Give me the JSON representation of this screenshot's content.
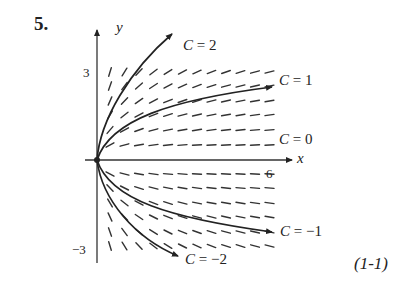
{
  "problem": {
    "number": "5."
  },
  "axes": {
    "x_label": "x",
    "y_label": "y",
    "x_tick": "6",
    "y_tick_top": "3",
    "y_tick_bottom": "−3"
  },
  "curves": [
    {
      "c_symbol": "C",
      "eq": " = 2"
    },
    {
      "c_symbol": "C",
      "eq": " = 1"
    },
    {
      "c_symbol": "C",
      "eq": " = 0"
    },
    {
      "c_symbol": "C",
      "eq": " = −1"
    },
    {
      "c_symbol": "C",
      "eq": " = −2"
    }
  ],
  "reference": "(1-1)",
  "chart_data": {
    "type": "slope_field",
    "xlabel": "x",
    "ylabel": "y",
    "xlim": [
      0,
      6
    ],
    "ylim": [
      -3,
      3
    ],
    "ticks": {
      "x": [
        "6"
      ],
      "y": [
        "3",
        "−3"
      ]
    },
    "solution_curves": [
      {
        "label": "C = 2",
        "shape": "y = C·sqrt(x)",
        "endpoint": [
          2.6,
          4.4
        ]
      },
      {
        "label": "C = 1",
        "shape": "y = C·sqrt(x)",
        "endpoint": [
          6,
          2.5
        ]
      },
      {
        "label": "C = 0",
        "shape": "y = 0"
      },
      {
        "label": "C = −1",
        "shape": "y = C·sqrt(x)",
        "endpoint": [
          6,
          -2.5
        ]
      },
      {
        "label": "C = −2",
        "shape": "y = C·sqrt(x)",
        "endpoint": [
          2.8,
          -3.2
        ]
      }
    ],
    "grid": false,
    "equation_ref": "(1-1)"
  }
}
